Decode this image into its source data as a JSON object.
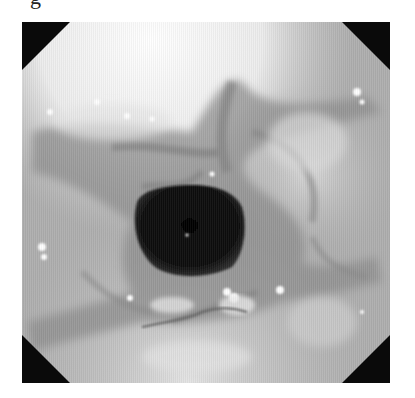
{
  "figure": {
    "clipped_label_glyph": "g",
    "frame": {
      "x": 22,
      "y": 22,
      "width": 368,
      "height": 361,
      "corner_color": "#0a0a0a",
      "corner_size": 48
    },
    "lumen": {
      "center_x": 187,
      "center_y": 228,
      "width": 116,
      "height": 88,
      "color": "#0b0b0b"
    },
    "tones": {
      "bright_upper": "#f2f2f2",
      "mucosa_mid": "#b4b4b4",
      "mucosa_dark": "#8c8c8c",
      "fold_shadow": "#7a7a7a",
      "highlight": "#ffffff"
    }
  }
}
